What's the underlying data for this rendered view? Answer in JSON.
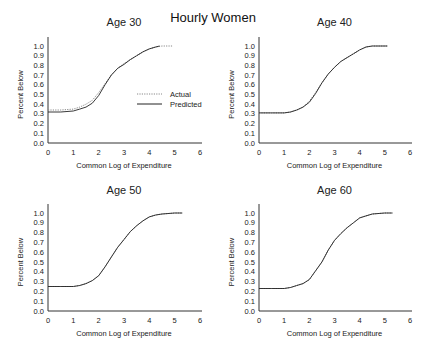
{
  "figure": {
    "title": "Hourly Women"
  },
  "chart_data": [
    {
      "type": "line",
      "title": "Age 30",
      "xlabel": "Common Log of Expenditure",
      "ylabel": "Percent Below",
      "xlim": [
        0,
        6
      ],
      "ylim": [
        0,
        1.0
      ],
      "xticks": [
        "0",
        "1",
        "2",
        "3",
        "4",
        "5",
        "6"
      ],
      "yticks": [
        "0.0",
        "0.1",
        "0.2",
        "0.3",
        "0.4",
        "0.5",
        "0.6",
        "0.7",
        "0.8",
        "0.9",
        "1.0"
      ],
      "grid": false,
      "legend": {
        "position": "inside-right",
        "entries": [
          "Actual",
          "Predicted"
        ]
      },
      "series": [
        {
          "name": "Actual",
          "style": "dotted",
          "x": [
            0,
            0.5,
            1.0,
            1.25,
            1.5,
            1.75,
            2.0,
            2.25,
            2.5,
            2.75,
            3.0,
            3.25,
            3.5,
            3.75,
            4.0,
            4.25,
            4.5,
            4.9
          ],
          "y": [
            0.34,
            0.34,
            0.35,
            0.37,
            0.4,
            0.44,
            0.52,
            0.61,
            0.7,
            0.77,
            0.82,
            0.86,
            0.9,
            0.94,
            0.97,
            0.99,
            1.0,
            1.0
          ]
        },
        {
          "name": "Predicted",
          "style": "solid",
          "x": [
            0,
            0.5,
            1.0,
            1.25,
            1.5,
            1.75,
            2.0,
            2.25,
            2.5,
            2.75,
            3.0,
            3.25,
            3.5,
            3.75,
            4.0,
            4.25,
            4.4
          ],
          "y": [
            0.32,
            0.32,
            0.33,
            0.35,
            0.37,
            0.41,
            0.49,
            0.6,
            0.7,
            0.77,
            0.81,
            0.86,
            0.9,
            0.94,
            0.97,
            0.99,
            1.0
          ]
        }
      ]
    },
    {
      "type": "line",
      "title": "Age 40",
      "xlabel": "Common Log of Expenditure",
      "ylabel": "Percent Below",
      "xlim": [
        0,
        6
      ],
      "ylim": [
        0,
        1.0
      ],
      "xticks": [
        "0",
        "1",
        "2",
        "3",
        "4",
        "5",
        "6"
      ],
      "yticks": [
        "0.0",
        "0.1",
        "0.2",
        "0.3",
        "0.4",
        "0.5",
        "0.6",
        "0.7",
        "0.8",
        "0.9",
        "1.0"
      ],
      "grid": false,
      "series": [
        {
          "name": "Actual",
          "style": "dotted",
          "x": [
            0,
            0.5,
            1.0,
            1.25,
            1.5,
            1.75,
            2.0,
            2.25,
            2.5,
            2.75,
            3.0,
            3.25,
            3.5,
            3.75,
            4.0,
            4.25,
            4.5,
            5.1
          ],
          "y": [
            0.31,
            0.31,
            0.31,
            0.32,
            0.34,
            0.37,
            0.43,
            0.52,
            0.62,
            0.71,
            0.78,
            0.84,
            0.88,
            0.92,
            0.96,
            0.99,
            1.0,
            1.0
          ]
        },
        {
          "name": "Predicted",
          "style": "solid",
          "x": [
            0,
            0.5,
            1.0,
            1.25,
            1.5,
            1.75,
            2.0,
            2.25,
            2.5,
            2.75,
            3.0,
            3.25,
            3.5,
            3.75,
            4.0,
            4.25,
            4.5,
            5.1
          ],
          "y": [
            0.31,
            0.31,
            0.31,
            0.32,
            0.34,
            0.37,
            0.42,
            0.51,
            0.62,
            0.71,
            0.78,
            0.84,
            0.88,
            0.92,
            0.96,
            0.99,
            1.0,
            1.0
          ]
        }
      ]
    },
    {
      "type": "line",
      "title": "Age 50",
      "xlabel": "Common Log of Expenditure",
      "ylabel": "Percent Below",
      "xlim": [
        0,
        6
      ],
      "ylim": [
        0,
        1.0
      ],
      "xticks": [
        "0",
        "1",
        "2",
        "3",
        "4",
        "5",
        "6"
      ],
      "yticks": [
        "0.0",
        "0.1",
        "0.2",
        "0.3",
        "0.4",
        "0.5",
        "0.6",
        "0.7",
        "0.8",
        "0.9",
        "1.0"
      ],
      "grid": false,
      "series": [
        {
          "name": "Actual",
          "style": "dotted",
          "x": [
            0,
            0.5,
            1.0,
            1.25,
            1.5,
            1.75,
            2.0,
            2.25,
            2.5,
            2.75,
            3.0,
            3.25,
            3.5,
            3.75,
            4.0,
            4.25,
            4.5,
            5.0,
            5.3
          ],
          "y": [
            0.25,
            0.25,
            0.25,
            0.26,
            0.28,
            0.31,
            0.36,
            0.45,
            0.55,
            0.65,
            0.73,
            0.81,
            0.87,
            0.92,
            0.96,
            0.98,
            0.99,
            1.0,
            1.0
          ]
        },
        {
          "name": "Predicted",
          "style": "solid",
          "x": [
            0,
            0.5,
            1.0,
            1.25,
            1.5,
            1.75,
            2.0,
            2.25,
            2.5,
            2.75,
            3.0,
            3.25,
            3.5,
            3.75,
            4.0,
            4.25,
            4.5,
            5.0,
            5.3
          ],
          "y": [
            0.25,
            0.25,
            0.25,
            0.26,
            0.28,
            0.31,
            0.36,
            0.45,
            0.55,
            0.65,
            0.73,
            0.81,
            0.87,
            0.92,
            0.96,
            0.98,
            0.99,
            1.0,
            1.0
          ]
        }
      ]
    },
    {
      "type": "line",
      "title": "Age 60",
      "xlabel": "Common Log of Expenditure",
      "ylabel": "Percent Below",
      "xlim": [
        0,
        6
      ],
      "ylim": [
        0,
        1.0
      ],
      "xticks": [
        "0",
        "1",
        "2",
        "3",
        "4",
        "5",
        "6"
      ],
      "yticks": [
        "0.0",
        "0.1",
        "0.2",
        "0.3",
        "0.4",
        "0.5",
        "0.6",
        "0.7",
        "0.8",
        "0.9",
        "1.0"
      ],
      "grid": false,
      "series": [
        {
          "name": "Actual",
          "style": "dotted",
          "x": [
            0,
            0.5,
            1.0,
            1.25,
            1.5,
            1.75,
            2.0,
            2.25,
            2.5,
            2.75,
            3.0,
            3.25,
            3.5,
            3.75,
            4.0,
            4.25,
            4.5,
            5.0,
            5.3
          ],
          "y": [
            0.23,
            0.23,
            0.23,
            0.24,
            0.26,
            0.28,
            0.32,
            0.41,
            0.5,
            0.62,
            0.72,
            0.79,
            0.85,
            0.9,
            0.95,
            0.97,
            0.99,
            1.0,
            1.0
          ]
        },
        {
          "name": "Predicted",
          "style": "solid",
          "x": [
            0,
            0.5,
            1.0,
            1.25,
            1.5,
            1.75,
            2.0,
            2.25,
            2.5,
            2.75,
            3.0,
            3.25,
            3.5,
            3.75,
            4.0,
            4.25,
            4.5,
            5.0,
            5.3
          ],
          "y": [
            0.23,
            0.23,
            0.23,
            0.24,
            0.26,
            0.28,
            0.32,
            0.41,
            0.5,
            0.62,
            0.72,
            0.79,
            0.85,
            0.9,
            0.95,
            0.97,
            0.99,
            1.0,
            1.0
          ]
        }
      ]
    }
  ],
  "layout": {
    "panels": [
      {
        "x0": 48,
        "x1": 200,
        "y0": 143,
        "y1": 46,
        "axis_top": 37,
        "title_y": 26
      },
      {
        "x0": 259,
        "x1": 410,
        "y0": 143,
        "y1": 46,
        "axis_top": 37,
        "title_y": 26
      },
      {
        "x0": 48,
        "x1": 200,
        "y0": 311,
        "y1": 213,
        "axis_top": 204,
        "title_y": 194
      },
      {
        "x0": 259,
        "x1": 410,
        "y0": 311,
        "y1": 213,
        "axis_top": 204,
        "title_y": 194
      }
    ],
    "legend": {
      "line_x0": 137,
      "line_x1": 162,
      "text_x": 170,
      "actual_y": 97,
      "predicted_y": 107
    },
    "colors": {
      "axis": "#333333",
      "actual": "#888888",
      "predicted": "#222222",
      "text": "#222222"
    }
  }
}
